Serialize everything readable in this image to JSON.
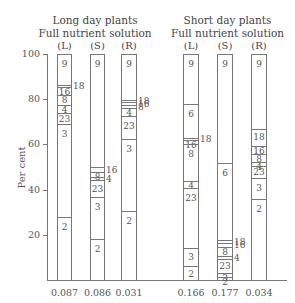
{
  "chart_data": {
    "type": "bar",
    "stacked": true,
    "ylabel": "Per cent",
    "ylim": [
      0,
      100
    ],
    "yticks": [
      20,
      40,
      60,
      80,
      100
    ],
    "groups": [
      {
        "title_line1": "Long day plants",
        "title_line2": "Full nutrient solution",
        "columns": [
          {
            "head": "(L)",
            "foot": "0.087",
            "segments": [
              {
                "label": "9",
                "value": 13.3
              },
              {
                "label": "18",
                "value": 0.9,
                "outside": true
              },
              {
                "label": "16",
                "value": 3.5
              },
              {
                "label": "8",
                "value": 4.4
              },
              {
                "label": "4",
                "value": 3.6
              },
              {
                "label": "23",
                "value": 4.8
              },
              {
                "label": "3",
                "value": 41.2
              },
              {
                "label": "2",
                "value": 28.3
              }
            ]
          },
          {
            "head": "(S)",
            "foot": "0.086",
            "segments": [
              {
                "label": "9",
                "value": 49.6
              },
              {
                "label": "16",
                "value": 2.2,
                "outside": true
              },
              {
                "label": "8",
                "value": 2.2
              },
              {
                "label": "4",
                "value": 1.4,
                "outside": true
              },
              {
                "label": "23",
                "value": 7.4
              },
              {
                "label": "3",
                "value": 18.6
              },
              {
                "label": "2",
                "value": 18.6
              }
            ]
          },
          {
            "head": "(R)",
            "foot": "0.031",
            "segments": [
              {
                "label": "9",
                "value": 20.0
              },
              {
                "label": "18",
                "value": 1.0,
                "outside": true
              },
              {
                "label": "16",
                "value": 1.3,
                "outside": true
              },
              {
                "label": "8",
                "value": 1.3,
                "outside": true
              },
              {
                "label": "4",
                "value": 3.5
              },
              {
                "label": "23",
                "value": 10.2
              },
              {
                "label": "3",
                "value": 31.8
              },
              {
                "label": "2",
                "value": 31.0
              }
            ]
          }
        ]
      },
      {
        "title_line1": "Short day plants",
        "title_line2": "Full nutrient solution",
        "columns": [
          {
            "head": "(L)",
            "foot": "0.166",
            "segments": [
              {
                "label": "9",
                "value": 21.7
              },
              {
                "label": "6",
                "value": 15.0
              },
              {
                "label": "18",
                "value": 0.9,
                "outside": true
              },
              {
                "label": "16",
                "value": 1.8
              },
              {
                "label": "8",
                "value": 16.4
              },
              {
                "label": "4",
                "value": 3.0
              },
              {
                "label": "23",
                "value": 26.6
              },
              {
                "label": "3",
                "value": 8.0
              },
              {
                "label": "2",
                "value": 6.6
              }
            ]
          },
          {
            "head": "(S)",
            "foot": "0.177",
            "segments": [
              {
                "label": "9",
                "value": 47.8
              },
              {
                "label": "6",
                "value": 34.1
              },
              {
                "label": "18",
                "value": 1.3,
                "outside": true
              },
              {
                "label": "16",
                "value": 1.8,
                "outside": true
              },
              {
                "label": "8",
                "value": 4.0
              },
              {
                "label": "4",
                "value": 1.3,
                "outside": true
              },
              {
                "label": "23",
                "value": 6.2
              },
              {
                "label": "3",
                "value": 1.7
              },
              {
                "label": "2",
                "value": 1.8
              }
            ]
          },
          {
            "head": "(R)",
            "foot": "0.034",
            "segments": [
              {
                "label": "9",
                "value": 32.7
              },
              {
                "label": "18",
                "value": 7.6
              },
              {
                "label": "16",
                "value": 3.5
              },
              {
                "label": "8",
                "value": 3.5
              },
              {
                "label": "4",
                "value": 1.8
              },
              {
                "label": "23",
                "value": 5.3
              },
              {
                "label": "3",
                "value": 9.3
              },
              {
                "label": "2",
                "value": 36.3
              }
            ]
          }
        ]
      }
    ]
  }
}
